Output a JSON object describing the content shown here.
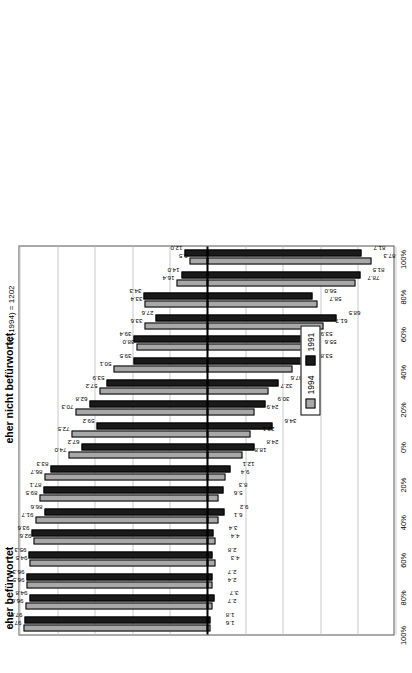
{
  "chart": {
    "type": "bar",
    "title": "",
    "note": "N (1994) = 1202",
    "axis_left_caption": "eher befürwortet",
    "axis_right_caption": "eher nicht befürwortet",
    "legend": {
      "position": "bottom-left",
      "entries": [
        {
          "name": "1994",
          "color": "#a8a8a8"
        },
        {
          "name": "1991",
          "color": "#1a1a1a"
        }
      ]
    },
    "tick_labels": [
      "100%",
      "80%",
      "60%",
      "40%",
      "20%",
      "0%",
      "20%",
      "40%",
      "60%",
      "80%",
      "100%"
    ],
    "tick_values": [
      100,
      80,
      60,
      40,
      20,
      0,
      -20,
      -40,
      -60,
      -80,
      -100
    ],
    "ylim": [
      -100,
      100
    ],
    "grid": true
  },
  "chart_data": {
    "type": "bar",
    "title": "",
    "xlabel": "",
    "ylabel": "",
    "ylim": [
      -100,
      100
    ],
    "grid": true,
    "legend_position": "bottom-left",
    "tick_labels": [
      "100%",
      "80%",
      "60%",
      "40%",
      "20%",
      "0%",
      "20%",
      "40%",
      "60%",
      "80%",
      "100%"
    ],
    "annotations": [
      "N (1994) = 1202",
      "eher befürwortet",
      "eher nicht befürwortet"
    ],
    "categories": [
      "Jugendlichen in Schwierigkeiten helfen",
      "Behandlungen anbieten",
      "Drogenprävention in der Schule",
      "Busse/Gefängnis für Dealer",
      "Bestrafung von Geldwäscherei",
      "Drogensüchtigen Lebenshilfe leisten",
      "Kampagnen zur Drogenprävention",
      "Aidsprävention (Spritzenverkauf/-abgabe)",
      "Verbesserung der Lebensbedingungen Jugendlicher",
      "Räume, wo man Drogen Spritzen kann",
      "Ärztlich kontrollierte Drogenabgabe",
      "Schliessung offener Szenen",
      "Tolerierung von Haschisch in kleinen Mengen",
      "Tolerierung öffentlicher Plätze für Drogensüchtige",
      "Freier Verkauf von Haschisch",
      "Zwangsentzug",
      "Tolerierung harter Drogen in kleinen Mengen",
      "Busse/Gefängnis für Drogensüchtige"
    ],
    "series": [
      {
        "name": "1994",
        "color": "#a8a8a8",
        "pro": [
          97.7,
          96.6,
          96.5,
          94.5,
          92.6,
          91.7,
          89.5,
          86.7,
          74.0,
          72.5,
          70.3,
          57.2,
          50.1,
          38.0,
          33.6,
          33.4,
          16.4,
          9.5
        ],
        "contra": [
          1.6,
          2.7,
          2.4,
          4.3,
          4.4,
          6.1,
          5.6,
          9.4,
          18.8,
          23.1,
          24.9,
          32.7,
          45.0,
          55.6,
          61.7,
          58.7,
          78.7,
          87.3
        ]
      },
      {
        "name": "1991",
        "color": "#1a1a1a",
        "pro": [
          97.6,
          94.8,
          96.3,
          95.3,
          93.6,
          86.6,
          87.1,
          83.3,
          67.2,
          59.2,
          62.8,
          53.9,
          39.5,
          39.4,
          27.6,
          34.3,
          14.0,
          12.0
        ],
        "contra": [
          1.8,
          3.7,
          2.7,
          2.8,
          3.4,
          9.2,
          8.3,
          12.1,
          24.8,
          34.6,
          30.9,
          37.6,
          53.8,
          53.9,
          68.5,
          56.0,
          81.5,
          81.7
        ]
      }
    ]
  }
}
